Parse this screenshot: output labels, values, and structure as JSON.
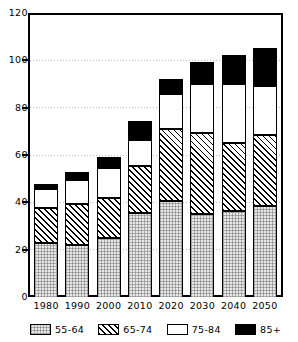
{
  "chart_data": {
    "type": "bar",
    "subtype": "stacked-bar",
    "title": "",
    "xlabel": "",
    "ylabel": "",
    "ylim": [
      0,
      120
    ],
    "yticks": [
      0,
      20,
      40,
      60,
      80,
      100,
      120
    ],
    "grid": true,
    "grid_axis": "y",
    "legend_position": "bottom",
    "categories": [
      "1980",
      "1990",
      "2000",
      "2010",
      "2020",
      "2030",
      "2040",
      "2050"
    ],
    "series": [
      {
        "name": "55-64",
        "pattern": "light-gray-dotted",
        "color": "#e8e8e8",
        "values": [
          23,
          22,
          25,
          36,
          41,
          35.5,
          36.5,
          39
        ]
      },
      {
        "name": "65-74",
        "pattern": "diagonal-hatch",
        "color": "#ffffff",
        "values": [
          15,
          17.5,
          17,
          20,
          30.5,
          34.5,
          29,
          30
        ]
      },
      {
        "name": "75-84",
        "pattern": "solid-white",
        "color": "#ffffff",
        "values": [
          8,
          10.5,
          13,
          11,
          15,
          21,
          25.5,
          21
        ]
      },
      {
        "name": "85+",
        "pattern": "solid-black",
        "color": "#000000",
        "values": [
          2,
          3.5,
          4.5,
          8,
          6.5,
          9,
          12,
          16
        ]
      }
    ],
    "totals": [
      48,
      53.5,
      59.5,
      75,
      93,
      100,
      103,
      106
    ],
    "cumulative_tops": {
      "1980": [
        23,
        38,
        46,
        48
      ],
      "1990": [
        22,
        39.5,
        50,
        53.5
      ],
      "2000": [
        25,
        42,
        55,
        59.5
      ],
      "2010": [
        36,
        56,
        67,
        75
      ],
      "2020": [
        41,
        71.5,
        86,
        93
      ],
      "2030": [
        35.5,
        70,
        91,
        100
      ],
      "2040": [
        36.5,
        65.5,
        91,
        103
      ],
      "2050": [
        39,
        69,
        90,
        106
      ]
    }
  },
  "axes": {
    "y_tick_labels": [
      "0",
      "20",
      "40",
      "60",
      "80",
      "100",
      "120"
    ],
    "x_tick_labels": [
      "1980",
      "1990",
      "2000",
      "2010",
      "2020",
      "2030",
      "2040",
      "2050"
    ]
  },
  "legend": {
    "items": [
      {
        "label": "55-64"
      },
      {
        "label": "65-74"
      },
      {
        "label": "75-84"
      },
      {
        "label": "85+"
      }
    ]
  }
}
